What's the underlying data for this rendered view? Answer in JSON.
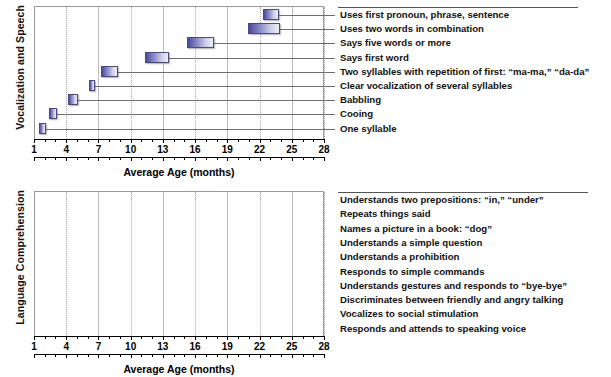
{
  "figure": {
    "background_color": "#ffffff",
    "bar_fill_dark": "#49499a",
    "bar_fill_light": "#eeeef6",
    "bar_border_color": "#4c4a7a",
    "grid_color": "#b9b9bd",
    "leader_color": "#6d6d72"
  },
  "chart_data": [
    {
      "type": "bar",
      "orientation": "horizontal",
      "subtype": "range-bar",
      "panel_id": "vocalization-and-speech",
      "title": "",
      "ylabel": "Vocalization and Speech",
      "xlabel": "Average Age (months)",
      "xlim": [
        1,
        28
      ],
      "xticks": [
        1,
        4,
        7,
        10,
        13,
        16,
        19,
        22,
        25,
        28
      ],
      "xtick_labels": [
        "1",
        "4",
        "7",
        "10",
        "13",
        "16",
        "19",
        "22",
        "25",
        "28"
      ],
      "minor_tick_step": 1,
      "grid": true,
      "legend": "none",
      "categories": [
        "Uses first pronoun, phrase, sentence",
        "Uses two words in combination",
        "Says five words or more",
        "Says first word",
        "Two syllables with repetition of first: “ma-ma,” “da-da”",
        "Clear vocalization of several syllables",
        "Babbling",
        "Cooing",
        "One syllable"
      ],
      "ranges": [
        {
          "label": "Uses first pronoun, phrase, sentence",
          "start": 22.3,
          "end": 23.8
        },
        {
          "label": "Uses two words in combination",
          "start": 20.9,
          "end": 23.9
        },
        {
          "label": "Says five words or more",
          "start": 15.2,
          "end": 17.8
        },
        {
          "label": "Says first word",
          "start": 11.3,
          "end": 13.6
        },
        {
          "label": "Two syllables with repetition of first: “ma-ma,” “da-da”",
          "start": 7.2,
          "end": 8.8
        },
        {
          "label": "Clear vocalization of several syllables",
          "start": 6.1,
          "end": 6.7
        },
        {
          "label": "Babbling",
          "start": 4.2,
          "end": 5.1
        },
        {
          "label": "Cooing",
          "start": 2.4,
          "end": 3.1
        },
        {
          "label": "One syllable",
          "start": 1.5,
          "end": 2.1
        }
      ]
    },
    {
      "type": "bar",
      "orientation": "horizontal",
      "subtype": "range-bar",
      "panel_id": "language-comprehension",
      "title": "",
      "ylabel": "Language Comprehension",
      "xlabel": "Average Age (months)",
      "xlim": [
        1,
        28
      ],
      "xticks": [
        1,
        4,
        7,
        10,
        13,
        16,
        19,
        22,
        25,
        28
      ],
      "xtick_labels": [
        "1",
        "4",
        "7",
        "10",
        "13",
        "16",
        "19",
        "22",
        "25",
        "28"
      ],
      "minor_tick_step": 1,
      "grid": true,
      "legend": "none",
      "categories": [
        "Understands two prepositions: “in,” “under”",
        "Repeats things said",
        "Names a picture in a book: “dog”",
        "Understands a simple question",
        "Understands a prohibition",
        "Responds to simple commands",
        "Understands gestures and responds to “bye-bye”",
        "Discriminates between friendly and angry talking",
        "Vocalizes to social stimulation",
        "Responds and attends to speaking voice"
      ],
      "ranges": [
        {
          "label": "Understands two prepositions: “in,” “under”",
          "start": 22.9,
          "end": 25.1
        },
        {
          "label": "Repeats things said",
          "start": 20.2,
          "end": 21.1
        },
        {
          "label": "Names a picture in a book: “dog”",
          "start": 19.2,
          "end": 23.1
        },
        {
          "label": "Understands a simple question",
          "start": 18.2,
          "end": 18.8
        },
        {
          "label": "Understands a prohibition",
          "start": 16.0,
          "end": 19.8
        },
        {
          "label": "Responds to simple commands",
          "start": 10.3,
          "end": 11.9
        },
        {
          "label": "Understands gestures and responds to “bye-bye”",
          "start": 9.2,
          "end": 9.8
        },
        {
          "label": "Discriminates between friendly and angry talking",
          "start": 5.6,
          "end": 6.2
        },
        {
          "label": "Vocalizes to social stimulation",
          "start": 3.0,
          "end": 4.0
        },
        {
          "label": "Responds and attends to speaking voice",
          "start": 1.0,
          "end": 1.7
        }
      ]
    }
  ]
}
